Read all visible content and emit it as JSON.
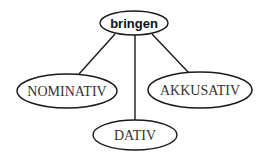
{
  "diagram": {
    "type": "tree",
    "root": {
      "label": "bringen"
    },
    "children": [
      {
        "label": "NOMINATIV"
      },
      {
        "label": "DATIV"
      },
      {
        "label": "AKKUSATIV"
      }
    ],
    "edges": [
      {
        "from": "bringen",
        "to": "NOMINATIV"
      },
      {
        "from": "bringen",
        "to": "DATIV"
      },
      {
        "from": "bringen",
        "to": "AKKUSATIV"
      }
    ]
  }
}
